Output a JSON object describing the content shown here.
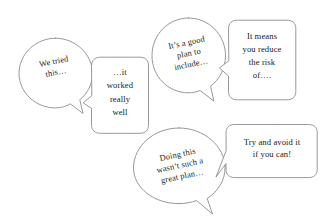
{
  "diagram": {
    "background_color": "#ffffff",
    "stroke_color": "#8d8d8d",
    "text_color": "#1a1a1a",
    "bubbles": [
      {
        "id": "we-tried-this",
        "shape": "oval",
        "text": "We tried\nthis…",
        "tail": "bottom-right",
        "rotation_deg": -11
      },
      {
        "id": "it-worked-really-well",
        "shape": "rounded-rect",
        "text": "…it\nworked\nreally\nwell",
        "tail": "left",
        "rotation_deg": 0
      },
      {
        "id": "its-a-good-plan",
        "shape": "oval",
        "text": "It’s a good\nplan to\ninclude…",
        "tail": "bottom-right",
        "rotation_deg": -12
      },
      {
        "id": "it-means-you-reduce",
        "shape": "rounded-rect",
        "text": "It means\nyou reduce\nthe risk\nof….",
        "tail": "left",
        "rotation_deg": 0
      },
      {
        "id": "doing-this-wasnt",
        "shape": "oval",
        "text": "Doing this\nwasn’t such a\ngreat plan…",
        "tail": "bottom-right",
        "rotation_deg": -12
      },
      {
        "id": "try-and-avoid-it",
        "shape": "rounded-rect",
        "text": "Try and avoid it\nif you can!",
        "tail": "left",
        "rotation_deg": 0
      }
    ]
  }
}
